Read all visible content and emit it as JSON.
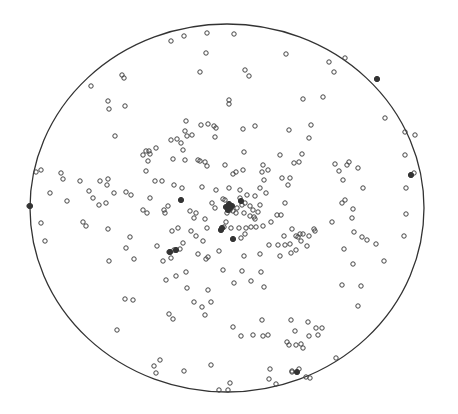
{
  "chart_data": {
    "type": "scatter",
    "title": "",
    "xlabel": "",
    "ylabel": "",
    "grid": false,
    "legend": null,
    "primitive_circle": {
      "cx": 227,
      "cy": 208,
      "rx": 197,
      "ry": 184,
      "stroke": "#333333"
    },
    "marker": {
      "shape": "open-circle",
      "r": 2.2,
      "stroke": "#444444",
      "filled_stroke": "#333333"
    },
    "points": [
      [
        171,
        41
      ],
      [
        184,
        36
      ],
      [
        207,
        33
      ],
      [
        234,
        34
      ],
      [
        286,
        54
      ],
      [
        329,
        62
      ],
      [
        345,
        58
      ],
      [
        334,
        72
      ],
      [
        377,
        79
      ],
      [
        415,
        135
      ],
      [
        206,
        53
      ],
      [
        200,
        72
      ],
      [
        245,
        70
      ],
      [
        249,
        76
      ],
      [
        229,
        100
      ],
      [
        229,
        104
      ],
      [
        303,
        99
      ],
      [
        323,
        97
      ],
      [
        311,
        125
      ],
      [
        385,
        118
      ],
      [
        91,
        86
      ],
      [
        122,
        75
      ],
      [
        124,
        78
      ],
      [
        108,
        101
      ],
      [
        109,
        109
      ],
      [
        125,
        106
      ],
      [
        201,
        125
      ],
      [
        243,
        129
      ],
      [
        255,
        126
      ],
      [
        186,
        121
      ],
      [
        173,
        159
      ],
      [
        143,
        155
      ],
      [
        149,
        151
      ],
      [
        150,
        154
      ],
      [
        156,
        148
      ],
      [
        171,
        140
      ],
      [
        177,
        139
      ],
      [
        187,
        136
      ],
      [
        192,
        135
      ],
      [
        215,
        137
      ],
      [
        214,
        126
      ],
      [
        208,
        124
      ],
      [
        216,
        128
      ],
      [
        185,
        131
      ],
      [
        181,
        143
      ],
      [
        200,
        161
      ],
      [
        198,
        160
      ],
      [
        202,
        187
      ],
      [
        244,
        152
      ],
      [
        115,
        136
      ],
      [
        185,
        160
      ],
      [
        183,
        150
      ],
      [
        148,
        161
      ],
      [
        146,
        171
      ],
      [
        146,
        151
      ],
      [
        205,
        162
      ],
      [
        207,
        166
      ],
      [
        225,
        165
      ],
      [
        216,
        190
      ],
      [
        36,
        172
      ],
      [
        41,
        170
      ],
      [
        61,
        173
      ],
      [
        63,
        179
      ],
      [
        80,
        181
      ],
      [
        100,
        181
      ],
      [
        108,
        179
      ],
      [
        114,
        193
      ],
      [
        126,
        192
      ],
      [
        50,
        193
      ],
      [
        83,
        222
      ],
      [
        86,
        226
      ],
      [
        67,
        201
      ],
      [
        29,
        206
      ],
      [
        41,
        223
      ],
      [
        45,
        241
      ],
      [
        108,
        229
      ],
      [
        130,
        237
      ],
      [
        165,
        213
      ],
      [
        168,
        206
      ],
      [
        89,
        191
      ],
      [
        99,
        205
      ],
      [
        106,
        203
      ],
      [
        143,
        210
      ],
      [
        147,
        213
      ],
      [
        155,
        181
      ],
      [
        162,
        181
      ],
      [
        174,
        185
      ],
      [
        182,
        188
      ],
      [
        150,
        198
      ],
      [
        131,
        195
      ],
      [
        93,
        198
      ],
      [
        107,
        185
      ],
      [
        190,
        211
      ],
      [
        205,
        219
      ],
      [
        194,
        218
      ],
      [
        196,
        213
      ],
      [
        215,
        208
      ],
      [
        212,
        203
      ],
      [
        223,
        199
      ],
      [
        233,
        174
      ],
      [
        236,
        172
      ],
      [
        243,
        170
      ],
      [
        229,
        188
      ],
      [
        240,
        190
      ],
      [
        247,
        195
      ],
      [
        255,
        196
      ],
      [
        260,
        188
      ],
      [
        266,
        193
      ],
      [
        262,
        172
      ],
      [
        263,
        165
      ],
      [
        264,
        180
      ],
      [
        250,
        206
      ],
      [
        253,
        210
      ],
      [
        258,
        212
      ],
      [
        237,
        208
      ],
      [
        242,
        205
      ],
      [
        233,
        211
      ],
      [
        236,
        213
      ],
      [
        230,
        210
      ],
      [
        227,
        213
      ],
      [
        229,
        206
      ],
      [
        231,
        206
      ],
      [
        225,
        200
      ],
      [
        240,
        198
      ],
      [
        245,
        203
      ],
      [
        244,
        213
      ],
      [
        250,
        216
      ],
      [
        255,
        219
      ],
      [
        256,
        227
      ],
      [
        226,
        222
      ],
      [
        231,
        228
      ],
      [
        224,
        227
      ],
      [
        239,
        228
      ],
      [
        246,
        228
      ],
      [
        263,
        226
      ],
      [
        271,
        222
      ],
      [
        277,
        215
      ],
      [
        281,
        215
      ],
      [
        285,
        203
      ],
      [
        282,
        178
      ],
      [
        290,
        178
      ],
      [
        288,
        185
      ],
      [
        302,
        154
      ],
      [
        309,
        138
      ],
      [
        289,
        130
      ],
      [
        280,
        155
      ],
      [
        294,
        163
      ],
      [
        299,
        162
      ],
      [
        268,
        170
      ],
      [
        335,
        164
      ],
      [
        349,
        162
      ],
      [
        347,
        165
      ],
      [
        339,
        171
      ],
      [
        343,
        180
      ],
      [
        358,
        168
      ],
      [
        363,
        188
      ],
      [
        406,
        188
      ],
      [
        411,
        175
      ],
      [
        414,
        173
      ],
      [
        405,
        155
      ],
      [
        405,
        132
      ],
      [
        406,
        214
      ],
      [
        404,
        236
      ],
      [
        345,
        200
      ],
      [
        342,
        203
      ],
      [
        353,
        209
      ],
      [
        352,
        218
      ],
      [
        332,
        222
      ],
      [
        315,
        231
      ],
      [
        314,
        229
      ],
      [
        300,
        234
      ],
      [
        298,
        237
      ],
      [
        303,
        234
      ],
      [
        296,
        236
      ],
      [
        284,
        236
      ],
      [
        309,
        236
      ],
      [
        290,
        244
      ],
      [
        291,
        253
      ],
      [
        296,
        250
      ],
      [
        241,
        238
      ],
      [
        245,
        234
      ],
      [
        251,
        227
      ],
      [
        254,
        217
      ],
      [
        260,
        205
      ],
      [
        269,
        245
      ],
      [
        292,
        229
      ],
      [
        301,
        241
      ],
      [
        354,
        232
      ],
      [
        362,
        237
      ],
      [
        367,
        240
      ],
      [
        344,
        249
      ],
      [
        353,
        264
      ],
      [
        384,
        261
      ],
      [
        376,
        244
      ],
      [
        307,
        246
      ],
      [
        278,
        245
      ],
      [
        285,
        245
      ],
      [
        280,
        256
      ],
      [
        180,
        249
      ],
      [
        169,
        252
      ],
      [
        174,
        250
      ],
      [
        183,
        243
      ],
      [
        196,
        236
      ],
      [
        203,
        241
      ],
      [
        207,
        228
      ],
      [
        191,
        231
      ],
      [
        178,
        228
      ],
      [
        172,
        231
      ],
      [
        164,
        210
      ],
      [
        126,
        248
      ],
      [
        157,
        246
      ],
      [
        109,
        261
      ],
      [
        134,
        259
      ],
      [
        163,
        261
      ],
      [
        171,
        258
      ],
      [
        198,
        254
      ],
      [
        208,
        257
      ],
      [
        219,
        251
      ],
      [
        223,
        270
      ],
      [
        206,
        259
      ],
      [
        166,
        280
      ],
      [
        176,
        276
      ],
      [
        186,
        272
      ],
      [
        194,
        302
      ],
      [
        187,
        288
      ],
      [
        202,
        307
      ],
      [
        211,
        302
      ],
      [
        169,
        314
      ],
      [
        173,
        319
      ],
      [
        205,
        315
      ],
      [
        234,
        283
      ],
      [
        244,
        256
      ],
      [
        251,
        281
      ],
      [
        242,
        271
      ],
      [
        208,
        290
      ],
      [
        264,
        287
      ],
      [
        260,
        254
      ],
      [
        261,
        272
      ],
      [
        262,
        320
      ],
      [
        291,
        320
      ],
      [
        295,
        331
      ],
      [
        263,
        336
      ],
      [
        287,
        342
      ],
      [
        268,
        335
      ],
      [
        308,
        322
      ],
      [
        316,
        328
      ],
      [
        322,
        328
      ],
      [
        342,
        285
      ],
      [
        361,
        286
      ],
      [
        358,
        306
      ],
      [
        336,
        358
      ],
      [
        309,
        336
      ],
      [
        296,
        345
      ],
      [
        301,
        344
      ],
      [
        292,
        372
      ],
      [
        318,
        335
      ],
      [
        289,
        345
      ],
      [
        125,
        299
      ],
      [
        133,
        300
      ],
      [
        117,
        330
      ],
      [
        160,
        360
      ],
      [
        154,
        366
      ],
      [
        156,
        373
      ],
      [
        184,
        371
      ],
      [
        233,
        327
      ],
      [
        211,
        365
      ],
      [
        230,
        383
      ],
      [
        228,
        390
      ],
      [
        219,
        390
      ],
      [
        269,
        379
      ],
      [
        276,
        384
      ],
      [
        306,
        377
      ],
      [
        310,
        378
      ],
      [
        292,
        371
      ],
      [
        303,
        348
      ],
      [
        299,
        369
      ],
      [
        241,
        336
      ],
      [
        270,
        369
      ],
      [
        253,
        335
      ]
    ],
    "filled_points": [
      [
        226,
        207
      ],
      [
        229,
        204
      ],
      [
        232,
        206
      ],
      [
        228,
        210
      ],
      [
        230,
        208
      ],
      [
        181,
        200
      ],
      [
        176,
        250
      ],
      [
        170,
        252
      ],
      [
        221,
        230
      ],
      [
        241,
        201
      ],
      [
        411,
        175
      ],
      [
        377,
        79
      ],
      [
        30,
        206
      ],
      [
        297,
        372
      ],
      [
        222,
        228
      ],
      [
        233,
        239
      ]
    ]
  }
}
